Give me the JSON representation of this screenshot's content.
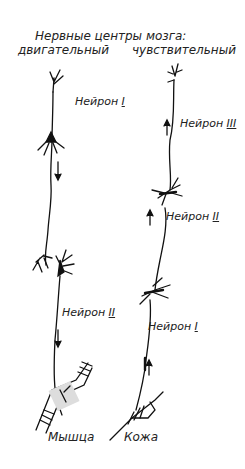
{
  "diagram": {
    "title": "Нервные центры мозга:",
    "columns": {
      "motor": "двигательный",
      "sensory": "чувствительный"
    },
    "motor_pathway": {
      "neurons": [
        {
          "label": "Нейрон",
          "numeral": "I"
        },
        {
          "label": "Нейрон",
          "numeral": "II"
        }
      ],
      "target": "Мышца",
      "direction": "down"
    },
    "sensory_pathway": {
      "neurons": [
        {
          "label": "Нейрон",
          "numeral": "III"
        },
        {
          "label": "Нейрон",
          "numeral": "II"
        },
        {
          "label": "Нейрон",
          "numeral": "I"
        }
      ],
      "source": "Кожа",
      "direction": "up"
    }
  }
}
